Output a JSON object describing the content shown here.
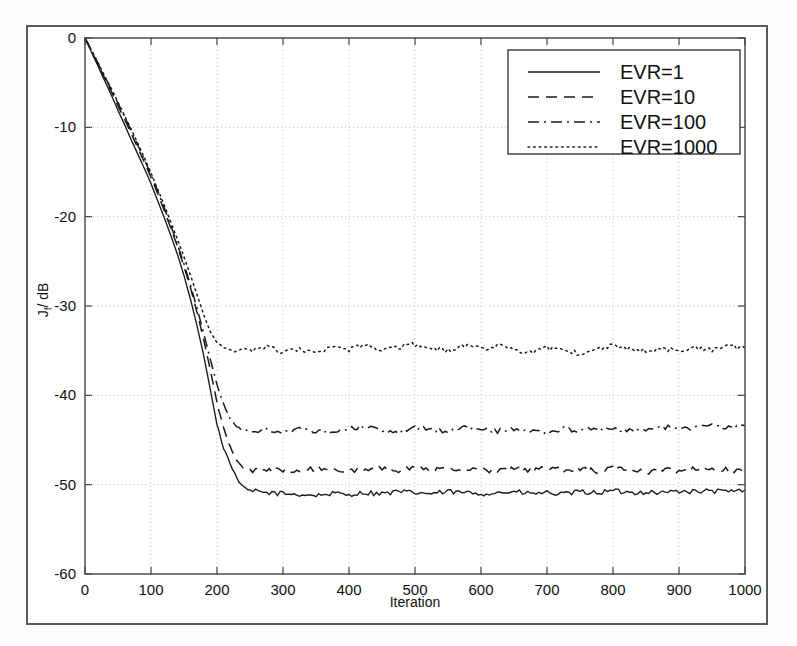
{
  "figure": {
    "background_color": "#ffffff",
    "frame_color": "#5a5a5a",
    "line_color": "#1a1a1a",
    "grid_color": "#bdbdbd"
  },
  "chart_data": {
    "type": "line",
    "title": "",
    "xlabel": "Iteration",
    "ylabel": "J_f / dB",
    "ylabel_base": "J",
    "ylabel_sub": "f",
    "ylabel_unit": "/ dB",
    "xlim": [
      0,
      1000
    ],
    "ylim": [
      -60,
      0
    ],
    "xticks": [
      0,
      100,
      200,
      300,
      400,
      500,
      600,
      700,
      800,
      900,
      1000
    ],
    "xtick_labels": [
      "0",
      "100",
      "200",
      "300",
      "400",
      "500",
      "600",
      "700",
      "800",
      "900",
      "1000"
    ],
    "yticks": [
      0,
      -10,
      -20,
      -30,
      -40,
      -50,
      -60
    ],
    "ytick_labels": [
      "0",
      "-10",
      "-20",
      "-30",
      "-40",
      "-50",
      "-60"
    ],
    "grid": true,
    "grid_style": "dotted",
    "legend_position": "upper right",
    "series": [
      {
        "name": "EVR=1",
        "linestyle": "solid",
        "converged_level": -50.8,
        "knee_iteration": 225,
        "x": [
          0,
          10,
          20,
          30,
          40,
          50,
          60,
          70,
          80,
          90,
          100,
          110,
          120,
          130,
          140,
          150,
          160,
          170,
          180,
          190,
          200,
          210,
          220,
          230,
          240,
          250,
          275,
          300,
          325,
          350,
          375,
          400,
          425,
          450,
          475,
          500,
          525,
          550,
          575,
          600,
          625,
          650,
          675,
          700,
          725,
          750,
          775,
          800,
          825,
          850,
          875,
          900,
          925,
          950,
          975,
          1000
        ],
        "y": [
          0,
          -1.6,
          -3.2,
          -4.8,
          -6.4,
          -8.1,
          -9.7,
          -11.4,
          -13.0,
          -14.6,
          -16.3,
          -18.2,
          -20.1,
          -22.1,
          -24.2,
          -26.6,
          -29.3,
          -32.3,
          -35.6,
          -39.4,
          -43.3,
          -45.9,
          -47.6,
          -49.3,
          -50.3,
          -50.7,
          -50.9,
          -51.0,
          -51.1,
          -51.2,
          -51.0,
          -51.1,
          -50.9,
          -51.0,
          -50.8,
          -50.9,
          -51.0,
          -50.8,
          -50.9,
          -51.0,
          -50.9,
          -50.8,
          -51.0,
          -50.9,
          -51.1,
          -50.8,
          -50.9,
          -50.7,
          -50.9,
          -50.8,
          -50.9,
          -50.7,
          -50.8,
          -50.7,
          -50.8,
          -50.6
        ]
      },
      {
        "name": "EVR=10",
        "linestyle": "dashed",
        "converged_level": -48.3,
        "knee_iteration": 235,
        "x": [
          0,
          10,
          20,
          30,
          40,
          50,
          60,
          70,
          80,
          90,
          100,
          110,
          120,
          130,
          140,
          150,
          160,
          170,
          180,
          190,
          200,
          210,
          220,
          230,
          240,
          250,
          275,
          300,
          325,
          350,
          375,
          400,
          425,
          450,
          475,
          500,
          525,
          550,
          575,
          600,
          625,
          650,
          675,
          700,
          725,
          750,
          775,
          800,
          825,
          850,
          875,
          900,
          925,
          950,
          975,
          1000
        ],
        "y": [
          0,
          -1.5,
          -3.0,
          -4.5,
          -6.0,
          -7.6,
          -9.1,
          -10.7,
          -12.3,
          -13.9,
          -15.6,
          -17.4,
          -19.3,
          -21.3,
          -23.3,
          -25.6,
          -28.0,
          -30.8,
          -33.8,
          -37.2,
          -40.8,
          -43.7,
          -45.8,
          -47.3,
          -48.1,
          -48.4,
          -48.5,
          -48.3,
          -48.5,
          -48.2,
          -48.4,
          -48.3,
          -48.5,
          -48.2,
          -48.4,
          -48.1,
          -48.4,
          -48.2,
          -48.4,
          -48.3,
          -48.5,
          -48.2,
          -48.4,
          -48.1,
          -48.4,
          -48.2,
          -48.5,
          -48.2,
          -48.4,
          -48.6,
          -48.3,
          -48.5,
          -48.2,
          -48.4,
          -48.3,
          -48.5
        ]
      },
      {
        "name": "EVR=100",
        "linestyle": "dashdot",
        "converged_level": -43.8,
        "knee_iteration": 230,
        "x": [
          0,
          10,
          20,
          30,
          40,
          50,
          60,
          70,
          80,
          90,
          100,
          110,
          120,
          130,
          140,
          150,
          160,
          170,
          180,
          190,
          200,
          210,
          220,
          230,
          240,
          250,
          275,
          300,
          325,
          350,
          375,
          400,
          425,
          450,
          475,
          500,
          525,
          550,
          575,
          600,
          625,
          650,
          675,
          700,
          725,
          750,
          775,
          800,
          825,
          850,
          875,
          900,
          925,
          950,
          975,
          1000
        ],
        "y": [
          0,
          -1.4,
          -2.9,
          -4.3,
          -5.8,
          -7.3,
          -8.8,
          -10.4,
          -12.0,
          -13.6,
          -15.3,
          -17.1,
          -19.0,
          -21.0,
          -23.1,
          -25.3,
          -27.7,
          -30.3,
          -33.1,
          -36.0,
          -38.8,
          -41.0,
          -42.6,
          -43.5,
          -43.9,
          -44.0,
          -43.9,
          -44.1,
          -43.8,
          -44.2,
          -43.9,
          -43.7,
          -43.5,
          -43.9,
          -44.1,
          -43.6,
          -43.9,
          -44.0,
          -43.6,
          -43.8,
          -44.0,
          -43.7,
          -43.9,
          -44.1,
          -43.8,
          -44.0,
          -43.6,
          -43.8,
          -44.0,
          -43.7,
          -43.5,
          -43.8,
          -43.6,
          -43.4,
          -43.6,
          -43.4
        ]
      },
      {
        "name": "EVR=1000",
        "linestyle": "dotted",
        "converged_level": -34.8,
        "knee_iteration": 215,
        "x": [
          0,
          10,
          20,
          30,
          40,
          50,
          60,
          70,
          80,
          90,
          100,
          110,
          120,
          130,
          140,
          150,
          160,
          170,
          180,
          190,
          200,
          210,
          220,
          230,
          240,
          250,
          275,
          300,
          325,
          350,
          375,
          400,
          425,
          450,
          475,
          500,
          525,
          550,
          575,
          600,
          625,
          650,
          675,
          700,
          725,
          750,
          775,
          800,
          825,
          850,
          875,
          900,
          925,
          950,
          975,
          1000
        ],
        "y": [
          0,
          -1.4,
          -2.8,
          -4.3,
          -5.7,
          -7.2,
          -8.7,
          -10.2,
          -11.8,
          -13.4,
          -15.1,
          -16.9,
          -18.7,
          -20.6,
          -22.5,
          -24.5,
          -26.6,
          -28.8,
          -31.0,
          -32.9,
          -34.1,
          -34.7,
          -34.9,
          -35.1,
          -34.8,
          -35.0,
          -34.6,
          -35.2,
          -34.9,
          -35.3,
          -34.7,
          -34.9,
          -34.4,
          -35.0,
          -34.6,
          -34.3,
          -34.8,
          -35.0,
          -34.5,
          -34.8,
          -34.4,
          -34.9,
          -35.2,
          -34.7,
          -35.0,
          -35.3,
          -34.9,
          -34.3,
          -34.8,
          -35.1,
          -34.7,
          -35.0,
          -34.6,
          -34.9,
          -34.5,
          -34.7
        ]
      }
    ]
  },
  "legend": {
    "entries": [
      {
        "label": "EVR=1",
        "linestyle": "solid"
      },
      {
        "label": "EVR=10",
        "linestyle": "dashed"
      },
      {
        "label": "EVR=100",
        "linestyle": "dashdot"
      },
      {
        "label": "EVR=1000",
        "linestyle": "dotted"
      }
    ]
  }
}
